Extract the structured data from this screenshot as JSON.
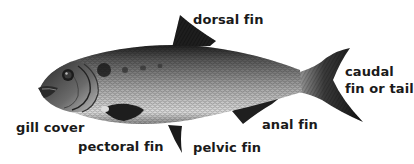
{
  "diagram": {
    "labels": {
      "dorsal_fin": "dorsal fin",
      "caudal_line1": "caudal",
      "caudal_line2": "fin or tail",
      "gill_cover": "gill cover",
      "pectoral_fin": "pectoral fin",
      "pelvic_fin": "pelvic fin",
      "anal_fin": "anal fin"
    },
    "colors": {
      "background": "#ffffff",
      "label_text": "#1a1a1a",
      "fin_dark": "#1c1c1c",
      "body_dark": "#3a3a3a",
      "body_light": "#d8d8d8"
    }
  }
}
